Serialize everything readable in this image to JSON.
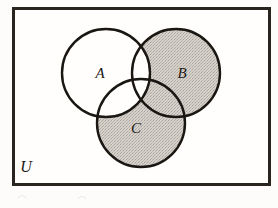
{
  "figure": {
    "kind": "venn-diagram",
    "set_count": 3,
    "caption_visible": false,
    "shaded_description": "(B union C) minus A",
    "background_color": "#fdfcfa",
    "paper_color": "#fffefc",
    "ink_color": "#1a1713",
    "shade_color": "#cfcbc3",
    "shade_texture": "stipple"
  },
  "universe": {
    "label": "U",
    "label_x": 26,
    "label_y": 172,
    "rect": {
      "x": 12,
      "y": 7,
      "width": 259,
      "height": 179
    },
    "border_color": "#2a241e",
    "border_width": 3
  },
  "sets": [
    {
      "name": "set-a",
      "label": "A",
      "label_x": 100,
      "label_y": 78,
      "cx": 106,
      "cy": 73,
      "r": 44,
      "shaded": false
    },
    {
      "name": "set-b",
      "label": "B",
      "label_x": 182,
      "label_y": 78,
      "cx": 176,
      "cy": 73,
      "r": 44,
      "shaded": true
    },
    {
      "name": "set-c",
      "label": "C",
      "label_x": 136,
      "label_y": 133,
      "cx": 141,
      "cy": 123,
      "r": 44,
      "shaded": true
    }
  ],
  "regions": [
    {
      "name": "region-a-only",
      "expression": "A \\ (B U C)",
      "shaded": false
    },
    {
      "name": "region-b-only",
      "expression": "B \\ (A U C)",
      "shaded": true
    },
    {
      "name": "region-c-only",
      "expression": "C \\ (A U B)",
      "shaded": true
    },
    {
      "name": "region-a-b",
      "expression": "(A n B) \\ C",
      "shaded": false
    },
    {
      "name": "region-a-c",
      "expression": "(A n C) \\ B",
      "shaded": false
    },
    {
      "name": "region-b-c",
      "expression": "(B n C) \\ A",
      "shaded": true
    },
    {
      "name": "region-a-b-c",
      "expression": "A n B n C",
      "shaded": false
    },
    {
      "name": "region-outside",
      "expression": "U \\ (A U B U C)",
      "shaded": false
    }
  ],
  "artifacts": {
    "bottom_marks_visible": true
  }
}
